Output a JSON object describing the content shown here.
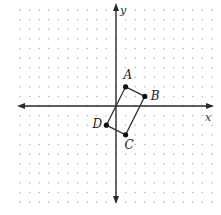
{
  "diagram": {
    "type": "coordinate-plane",
    "axes": {
      "x_label": "x",
      "y_label": "y"
    },
    "grid": {
      "style": "dot",
      "spacing_units": 1,
      "x_range": [
        -10,
        10
      ],
      "y_range": [
        -10,
        10
      ]
    },
    "colors": {
      "axis": "#2a2a2a",
      "grid_dot": "#c4c4c4",
      "polygon": "#333333",
      "point": "#111111"
    },
    "polygon": {
      "name": "ABCD",
      "vertices": [
        {
          "label": "A",
          "x": 1,
          "y": 2
        },
        {
          "label": "B",
          "x": 3,
          "y": 1
        },
        {
          "label": "C",
          "x": 1,
          "y": -3
        },
        {
          "label": "D",
          "x": -1,
          "y": -2
        }
      ]
    }
  }
}
